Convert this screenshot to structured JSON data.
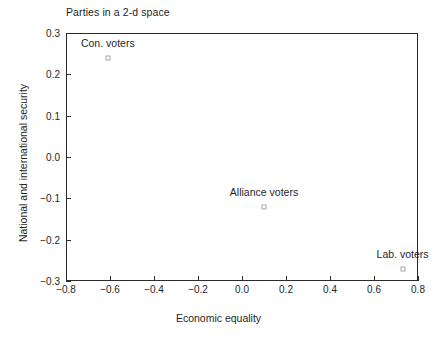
{
  "chart_data": {
    "type": "scatter",
    "title": "Parties in a 2-d space",
    "xlabel": "Economic equality",
    "ylabel": "National and international security",
    "xlim": [
      -0.8,
      0.8
    ],
    "ylim": [
      -0.3,
      0.3
    ],
    "xticks": [
      "-0.8",
      "-0.6",
      "-0.4",
      "-0.2",
      "0.0",
      "0.2",
      "0.4",
      "0.6",
      "0.8"
    ],
    "xtick_values": [
      -0.8,
      -0.6,
      -0.4,
      -0.2,
      0.0,
      0.2,
      0.4,
      0.6,
      0.8
    ],
    "yticks": [
      "0.3",
      "0.2",
      "0.1",
      "0.0",
      "-0.1",
      "-0.2",
      "-0.3"
    ],
    "ytick_values": [
      0.3,
      0.2,
      0.1,
      0.0,
      -0.1,
      -0.2,
      -0.3
    ],
    "grid": false,
    "legend": "none",
    "marker": "open-square",
    "points": [
      {
        "label": "Con. voters",
        "x": -0.61,
        "y": 0.24,
        "label_dx": 0,
        "label_dy": -9
      },
      {
        "label": "Alliance voters",
        "x": 0.1,
        "y": -0.12,
        "label_dx": 0,
        "label_dy": -9
      },
      {
        "label": "Lab. voters",
        "x": 0.73,
        "y": -0.27,
        "label_dx": 0,
        "label_dy": -9
      }
    ]
  }
}
